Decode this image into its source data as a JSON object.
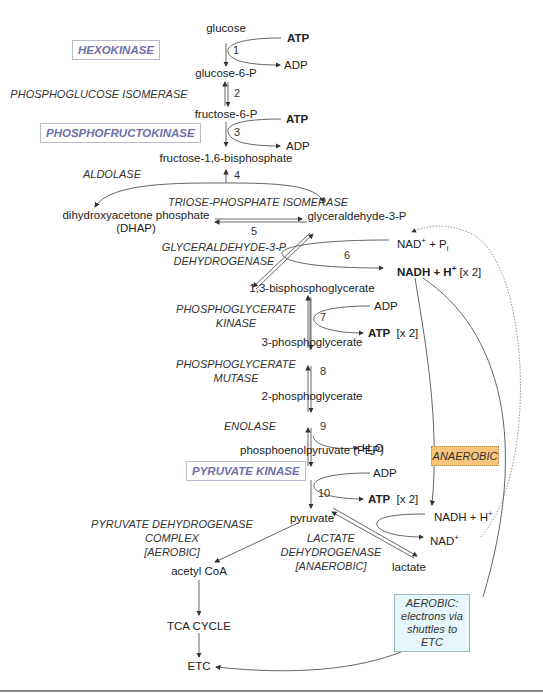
{
  "metabolites": {
    "glucose": "glucose",
    "g6p": "glucose-6-P",
    "f6p": "fructose-6-P",
    "f16bp": "fructose-1,6-bisphosphate",
    "dhap_line1": "dihydroxyacetone phosphate",
    "dhap_line2": "(DHAP)",
    "g3p": "glyceraldehyde-3-P",
    "bpg13": "1,3-bisphosphoglycerate",
    "pg3": "3-phosphoglycerate",
    "pg2": "2-phosphoglycerate",
    "pep": "phosphoenolpyruvate (PEP)",
    "pyruvate": "pyruvate",
    "acetyl_coa": "acetyl CoA",
    "tca": "TCA CYCLE",
    "etc": "ETC",
    "lactate": "lactate"
  },
  "cofactors": {
    "atp1": "ATP",
    "adp1": "ADP",
    "atp3": "ATP",
    "adp3": "ADP",
    "nad_in": "NAD",
    "nad_in_sup": "+",
    "pi": " + P",
    "pi_sub": "i",
    "nadh_out": "NADH + H",
    "nadh_out_sup": "+",
    "x2_6": "[x 2]",
    "adp7": "ADP",
    "atp7": "ATP",
    "x2_7": "[x 2]",
    "h2o_h": "H",
    "h2o_sub": "2",
    "h2o_o": "O",
    "adp10": "ADP",
    "atp10": "ATP",
    "x2_10": "[x 2]",
    "nadh_ldh": "NADH + H",
    "nadh_ldh_sup": "+",
    "nad_ldh": "NAD",
    "nad_ldh_sup": "+"
  },
  "steps": [
    "1",
    "2",
    "3",
    "4",
    "5",
    "6",
    "7",
    "8",
    "9",
    "10"
  ],
  "enzymes": {
    "hexokinase": "HEXOKINASE",
    "pgi": "PHOSPHOGLUCOSE ISOMERASE",
    "pfk": "PHOSPHOFRUCTOKINASE",
    "aldolase": "ALDOLASE",
    "tpi": "TRIOSE-PHOSPHATE ISOMERASE",
    "gapdh_1": "GLYCERALDEHYDE-3-P",
    "gapdh_2": "DEHYDROGENASE",
    "pgk_1": "PHOSPHOGLYCERATE",
    "pgk_2": "KINASE",
    "pgm_1": "PHOSPHOGLYCERATE",
    "pgm_2": "MUTASE",
    "enolase": "ENOLASE",
    "pk": "PYRUVATE KINASE",
    "pdh_1": "PYRUVATE DEHYDROGENASE",
    "pdh_2": "COMPLEX",
    "pdh_3": "[AEROBIC]",
    "ldh_1": "LACTATE",
    "ldh_2": "DEHYDROGENASE",
    "ldh_3": "[ANAEROBIC]"
  },
  "callouts": {
    "anaerobic": "ANAEROBIC",
    "aerobic_1": "AEROBIC:",
    "aerobic_2": "electrons via",
    "aerobic_3": "shuttles to",
    "aerobic_4": "ETC"
  },
  "colors": {
    "regulated_enzyme_text": "#6f6fa8",
    "regulated_enzyme_border": "#b9b9cf",
    "anaerobic_fill": "#f7c47a",
    "aerobic_fill": "#e6f6fa",
    "arrow": "#444444"
  }
}
